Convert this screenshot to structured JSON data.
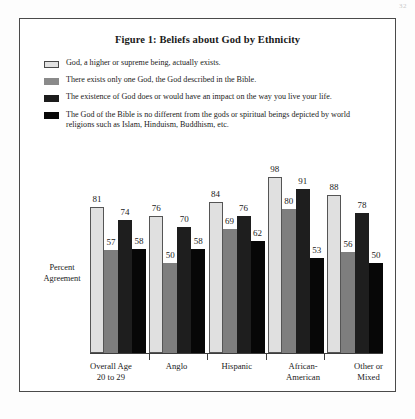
{
  "page": {
    "corner_artifact": "32"
  },
  "figure": {
    "title": "Figure 1: Beliefs about God by Ethnicity",
    "ylabel_line1": "Percent",
    "ylabel_line2": "Agreement"
  },
  "legend": {
    "items": [
      {
        "swatch": "light-gray",
        "label": "God, a higher or supreme being, actually exists."
      },
      {
        "swatch": "medium-gray",
        "label": "There exists only one God, the God described in the Bible."
      },
      {
        "swatch": "dark-gray",
        "label": "The existence of God does or would have an impact on the way you live your life."
      },
      {
        "swatch": "black",
        "label": "The God of the Bible is no different from the gods or spiritual beings depicted by world religions such as Islam, Hinduism, Buddhism, etc."
      }
    ]
  },
  "chart_data": {
    "type": "bar",
    "title": "Figure 1: Beliefs about God by Ethnicity",
    "xlabel": "",
    "ylabel": "Percent Agreement",
    "ylim": [
      0,
      100
    ],
    "grid": false,
    "legend_position": "top",
    "categories": [
      "Overall Age 20 to 29",
      "Anglo",
      "Hispanic",
      "African-American",
      "Other or Mixed"
    ],
    "category_lines": [
      [
        "Overall Age",
        "20 to 29"
      ],
      [
        "Anglo",
        ""
      ],
      [
        "Hispanic",
        ""
      ],
      [
        "African-",
        "American"
      ],
      [
        "Other or",
        "Mixed"
      ]
    ],
    "series": [
      {
        "name": "God, a higher or supreme being, actually exists.",
        "color": "#e0e0e0",
        "values": [
          81,
          76,
          84,
          98,
          88
        ]
      },
      {
        "name": "There exists only one God, the God described in the Bible.",
        "color": "#7e7e7e",
        "values": [
          57,
          50,
          69,
          80,
          56
        ]
      },
      {
        "name": "The existence of God does or would have an impact on the way you live your life.",
        "color": "#1e1e1e",
        "values": [
          74,
          70,
          76,
          91,
          78
        ]
      },
      {
        "name": "The God of the Bible is no different from the gods or spiritual beings depicted by world religions such as Islam, Hinduism, Buddhism, etc.",
        "color": "#070707",
        "values": [
          58,
          58,
          62,
          53,
          50
        ]
      }
    ]
  }
}
